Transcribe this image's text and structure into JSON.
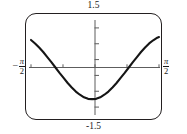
{
  "figure": {
    "kind": "graphing-calculator-screen",
    "curve_color": "#151515",
    "axis_color": "#5d5d5d",
    "bezel_color": "#231f20"
  },
  "labels": {
    "top": "1.5",
    "bottom": "-1.5",
    "left_minus": "−",
    "left_num": "π",
    "left_den": "2",
    "right_num": "π",
    "right_den": "2"
  },
  "chart_data": {
    "type": "line",
    "title": "",
    "xlabel": "",
    "ylabel": "",
    "grid": false,
    "legend": false,
    "xlim": [
      -1.5707963,
      1.5707963
    ],
    "ylim": [
      -1.5,
      1.5
    ],
    "xtick_labels": [
      "-π/2",
      "π/2"
    ],
    "ytick_labels": [
      "1.5",
      "-1.5"
    ],
    "xticks": [
      -1.5707963,
      -0.7853982,
      0.0,
      0.7853982,
      1.5707963
    ],
    "yticks": [
      -1.25,
      -0.75,
      -0.25,
      0.25,
      0.75,
      1.25
    ],
    "annotations": [
      "window x: -pi/2 to pi/2",
      "window y: -1.5 to 1.5"
    ],
    "series": [
      {
        "name": "y = sin(2x + 2.1)",
        "x": [
          -1.5708,
          -1.4708,
          -1.3708,
          -1.2708,
          -1.1708,
          -1.0708,
          -0.9708,
          -0.8708,
          -0.7708,
          -0.6708,
          -0.5708,
          -0.4708,
          -0.3708,
          -0.2708,
          -0.1708,
          -0.0708,
          0.0292,
          0.1292,
          0.2292,
          0.3292,
          0.4292,
          0.5292,
          0.6292,
          0.7292,
          0.8292,
          0.9292,
          1.0292,
          1.1292,
          1.2292,
          1.3292,
          1.4292,
          1.5292,
          1.5708
        ],
        "y": [
          0.87,
          0.76,
          0.63,
          0.49,
          0.33,
          0.17,
          0.0,
          -0.17,
          -0.33,
          -0.49,
          -0.63,
          -0.76,
          -0.86,
          -0.94,
          -0.99,
          -1.0,
          -0.99,
          -0.94,
          -0.86,
          -0.76,
          -0.63,
          -0.49,
          -0.33,
          -0.17,
          0.0,
          0.17,
          0.33,
          0.49,
          0.63,
          0.76,
          0.86,
          0.94,
          0.96
        ]
      }
    ]
  }
}
